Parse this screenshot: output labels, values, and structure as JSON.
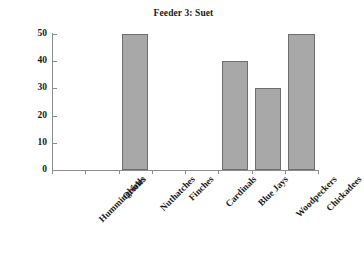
{
  "chart_data": {
    "type": "bar",
    "title": "Feeder 3: Suet",
    "xlabel": "",
    "ylabel": "",
    "categories": [
      "Hummingbirds",
      "Orioles",
      "Nuthatches",
      "Finches",
      "Cardinals",
      "Blue Jays",
      "Woodpeckers",
      "Chickadees"
    ],
    "values": [
      0,
      0,
      50,
      0,
      0,
      40,
      30,
      50
    ],
    "ylim": [
      0,
      50
    ],
    "yticks": [
      0,
      10,
      20,
      30,
      40,
      50
    ],
    "ytick_labels": [
      "0",
      "10",
      "20",
      "30",
      "40",
      "50"
    ],
    "grid": false,
    "legend": false,
    "bar_color": "#a8a8a8",
    "bar_edge_color": "#6e6e6e",
    "axis_color": "#8c8c8c",
    "text_color": "#1a1a1a",
    "background": "#ffffff"
  }
}
